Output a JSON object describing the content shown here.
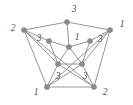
{
  "figure": {
    "kind": "graph-diagram",
    "width": 133,
    "height": 105,
    "background_color": "#ffffff",
    "edge_color": "#8a8a8a",
    "vertex_color": "#8d8d8d",
    "label_color": "#4d4d4d"
  },
  "chart_data": {
    "type": "diagram",
    "vertices": [
      {
        "id": "o-top",
        "label": "3",
        "x": 67,
        "y": 22,
        "ring": "outer",
        "label_x": 74,
        "label_y": 10
      },
      {
        "id": "o-left",
        "label": "2",
        "x": 24,
        "y": 30,
        "ring": "outer",
        "label_x": 13,
        "label_y": 29
      },
      {
        "id": "o-right",
        "label": "1",
        "x": 110,
        "y": 30,
        "ring": "outer",
        "label_x": 122,
        "label_y": 25
      },
      {
        "id": "o-bleft",
        "label": "1",
        "x": 47,
        "y": 87,
        "ring": "outer",
        "label_x": 36,
        "label_y": 93
      },
      {
        "id": "o-bright",
        "label": "2",
        "x": 94,
        "y": 87,
        "ring": "outer",
        "label_x": 105,
        "label_y": 93
      },
      {
        "id": "i-top",
        "label": "1",
        "x": 69,
        "y": 47,
        "ring": "inner",
        "label_x": 77,
        "label_y": 38
      },
      {
        "id": "i-left",
        "label": "3",
        "x": 49,
        "y": 41,
        "ring": "inner",
        "label_x": 39,
        "label_y": 39
      },
      {
        "id": "i-right",
        "label": "3",
        "x": 90,
        "y": 41,
        "ring": "inner",
        "label_x": 100,
        "label_y": 40
      },
      {
        "id": "i-bleft",
        "label": "3",
        "x": 58,
        "y": 64,
        "ring": "inner",
        "label_x": 58,
        "label_y": 77
      },
      {
        "id": "i-bright",
        "label": "3",
        "x": 82,
        "y": 64,
        "ring": "inner",
        "label_x": 85,
        "label_y": 77
      }
    ],
    "edges": [
      {
        "from": "o-top",
        "to": "o-left",
        "group": "outer-cycle"
      },
      {
        "from": "o-top",
        "to": "o-right",
        "group": "outer-cycle"
      },
      {
        "from": "o-left",
        "to": "o-bleft",
        "group": "outer-cycle"
      },
      {
        "from": "o-right",
        "to": "o-bright",
        "group": "outer-cycle"
      },
      {
        "from": "o-bleft",
        "to": "o-bright",
        "group": "outer-cycle"
      },
      {
        "from": "o-top",
        "to": "i-top",
        "group": "spoke"
      },
      {
        "from": "o-left",
        "to": "i-left",
        "group": "spoke"
      },
      {
        "from": "o-right",
        "to": "i-right",
        "group": "spoke"
      },
      {
        "from": "o-bleft",
        "to": "i-bleft",
        "group": "spoke"
      },
      {
        "from": "o-bright",
        "to": "i-bright",
        "group": "spoke"
      },
      {
        "from": "i-left",
        "to": "i-top",
        "group": "inner-star"
      },
      {
        "from": "i-top",
        "to": "i-right",
        "group": "inner-star"
      },
      {
        "from": "i-left",
        "to": "i-bleft",
        "group": "inner-star"
      },
      {
        "from": "i-right",
        "to": "i-bright",
        "group": "inner-star"
      },
      {
        "from": "i-bleft",
        "to": "i-bright",
        "group": "inner-star"
      },
      {
        "from": "i-top",
        "to": "i-bleft",
        "group": "inner-star"
      },
      {
        "from": "i-top",
        "to": "i-bright",
        "group": "inner-star"
      },
      {
        "from": "o-left",
        "to": "i-bleft",
        "group": "cross"
      },
      {
        "from": "o-right",
        "to": "i-bright",
        "group": "cross"
      },
      {
        "from": "o-bleft",
        "to": "i-bright",
        "group": "cross"
      },
      {
        "from": "o-bright",
        "to": "i-bleft",
        "group": "cross"
      },
      {
        "from": "o-left",
        "to": "o-bright",
        "group": "cross"
      },
      {
        "from": "o-right",
        "to": "o-bleft",
        "group": "cross"
      }
    ],
    "color_classes": {
      "1": 3,
      "2": 2,
      "3": 5
    },
    "legend": [],
    "xlabel": "",
    "ylabel": ""
  }
}
